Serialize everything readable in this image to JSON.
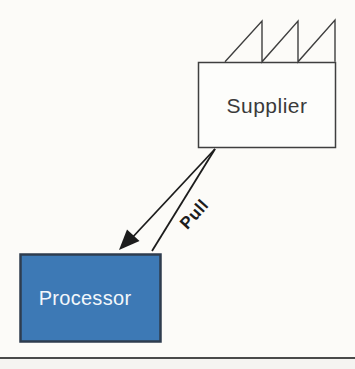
{
  "diagram": {
    "nodes": {
      "supplier": {
        "label": "Supplier",
        "shape": "factory-box-with-sawtooth-roof"
      },
      "processor": {
        "label": "Processor",
        "shape": "filled-box"
      }
    },
    "edges": {
      "pull_arrow": {
        "label": "Pull",
        "from": "supplier",
        "to": "processor",
        "style": "tapered-double-line-with-solid-arrowhead"
      }
    }
  },
  "colors": {
    "background": "#fcfbf8",
    "outline": "#3f3f3f",
    "supplier_fill": "#fdfdfb",
    "supplier_text": "#3a3a3a",
    "processor_fill": "#3d79b5",
    "processor_border": "#2e3c4e",
    "processor_text": "#f3f7fb",
    "arrow_color": "#1c1c1c",
    "rule_color": "#4a4a4a",
    "below_rule_fill": "#f5f4f1"
  }
}
